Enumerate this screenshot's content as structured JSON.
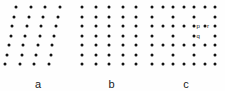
{
  "figure": {
    "width": 225,
    "height": 91,
    "background_color": "#fefefe",
    "dot_color": "#111111",
    "label_color": "#1a1a1a"
  },
  "chart_data": {
    "type": "scatter",
    "title": "",
    "subtitle": "",
    "xlabel": "",
    "ylabel": "",
    "grid": false,
    "legend": null,
    "panels": [
      {
        "id": "a",
        "label": "a",
        "lattice_type": "oblique",
        "rows": 7,
        "columns": 4,
        "row_spacing": 9.5,
        "column_spacing": 14.5,
        "row_shear_px": -1.8,
        "origin_x": 16,
        "origin_y": 7,
        "points": [
          [
            16.0,
            7.0
          ],
          [
            30.5,
            7.0
          ],
          [
            45.0,
            7.0
          ],
          [
            59.5,
            7.0
          ],
          [
            14.2,
            16.5
          ],
          [
            28.7,
            16.5
          ],
          [
            43.2,
            16.5
          ],
          [
            57.7,
            16.5
          ],
          [
            12.4,
            26.0
          ],
          [
            26.9,
            26.0
          ],
          [
            41.4,
            26.0
          ],
          [
            55.9,
            26.0
          ],
          [
            10.6,
            35.5
          ],
          [
            25.1,
            35.5
          ],
          [
            39.6,
            35.5
          ],
          [
            54.1,
            35.5
          ],
          [
            8.8,
            45.0
          ],
          [
            23.3,
            45.0
          ],
          [
            37.8,
            45.0
          ],
          [
            52.3,
            45.0
          ],
          [
            7.0,
            54.5
          ],
          [
            21.5,
            54.5
          ],
          [
            36.0,
            54.5
          ],
          [
            50.5,
            54.5
          ],
          [
            5.2,
            64.0
          ],
          [
            19.7,
            64.0
          ],
          [
            34.2,
            64.0
          ],
          [
            48.7,
            64.0
          ]
        ]
      },
      {
        "id": "b",
        "label": "b",
        "lattice_type": "square",
        "rows": 7,
        "columns": 5,
        "row_spacing": 9.5,
        "column_spacing": 13.5,
        "row_shear_px": 0,
        "origin_x": 6,
        "origin_y": 7,
        "points": [
          [
            6.0,
            7.0
          ],
          [
            19.5,
            7.0
          ],
          [
            33.0,
            7.0
          ],
          [
            46.5,
            7.0
          ],
          [
            60.0,
            7.0
          ],
          [
            6.0,
            16.5
          ],
          [
            19.5,
            16.5
          ],
          [
            33.0,
            16.5
          ],
          [
            46.5,
            16.5
          ],
          [
            60.0,
            16.5
          ],
          [
            6.0,
            26.0
          ],
          [
            19.5,
            26.0
          ],
          [
            33.0,
            26.0
          ],
          [
            46.5,
            26.0
          ],
          [
            60.0,
            26.0
          ],
          [
            6.0,
            35.5
          ],
          [
            19.5,
            35.5
          ],
          [
            33.0,
            35.5
          ],
          [
            46.5,
            35.5
          ],
          [
            60.0,
            35.5
          ],
          [
            6.0,
            45.0
          ],
          [
            19.5,
            45.0
          ],
          [
            33.0,
            45.0
          ],
          [
            46.5,
            45.0
          ],
          [
            60.0,
            45.0
          ],
          [
            6.0,
            54.5
          ],
          [
            19.5,
            54.5
          ],
          [
            33.0,
            54.5
          ],
          [
            46.5,
            54.5
          ],
          [
            60.0,
            54.5
          ],
          [
            6.0,
            64.0
          ],
          [
            19.5,
            64.0
          ],
          [
            33.0,
            64.0
          ],
          [
            46.5,
            64.0
          ],
          [
            60.0,
            64.0
          ]
        ]
      },
      {
        "id": "c",
        "label": "c",
        "lattice_type": "centred",
        "rows": 7,
        "columns": 7,
        "row_spacing": 9.5,
        "column_spacing": 10.5,
        "row_shear_px": 0,
        "origin_x": 5,
        "origin_y": 7,
        "full_rows": [
          1,
          3,
          5,
          7
        ],
        "sparse_rows": [
          2,
          4,
          6
        ],
        "sparse_row_columns": [
          1,
          3,
          5,
          7
        ],
        "points": [
          [
            5.0,
            7.0
          ],
          [
            15.5,
            7.0
          ],
          [
            26.0,
            7.0
          ],
          [
            36.5,
            7.0
          ],
          [
            47.0,
            7.0
          ],
          [
            57.5,
            7.0
          ],
          [
            68.0,
            7.0
          ],
          [
            5.0,
            16.5
          ],
          [
            26.0,
            16.5
          ],
          [
            47.0,
            16.5
          ],
          [
            68.0,
            16.5
          ],
          [
            5.0,
            26.0
          ],
          [
            15.5,
            26.0
          ],
          [
            26.0,
            26.0
          ],
          [
            36.5,
            26.0
          ],
          [
            47.0,
            26.0
          ],
          [
            57.5,
            26.0
          ],
          [
            68.0,
            26.0
          ],
          [
            5.0,
            35.5
          ],
          [
            26.0,
            35.5
          ],
          [
            47.0,
            35.5
          ],
          [
            68.0,
            35.5
          ],
          [
            5.0,
            45.0
          ],
          [
            15.5,
            45.0
          ],
          [
            26.0,
            45.0
          ],
          [
            36.5,
            45.0
          ],
          [
            47.0,
            45.0
          ],
          [
            57.5,
            45.0
          ],
          [
            68.0,
            45.0
          ],
          [
            5.0,
            54.5
          ],
          [
            26.0,
            54.5
          ],
          [
            47.0,
            54.5
          ],
          [
            68.0,
            54.5
          ],
          [
            5.0,
            64.0
          ],
          [
            15.5,
            64.0
          ],
          [
            26.0,
            64.0
          ],
          [
            36.5,
            64.0
          ],
          [
            47.0,
            64.0
          ],
          [
            57.5,
            64.0
          ],
          [
            68.0,
            64.0
          ]
        ],
        "annotations": [
          {
            "text": "p",
            "point_x": 47.0,
            "point_y": 26.0,
            "label_x": 49.5,
            "label_y": 26.0
          },
          {
            "text": "r",
            "point_x": 57.5,
            "point_y": 26.0,
            "label_x": 60.0,
            "label_y": 26.0
          },
          {
            "text": "q",
            "point_x": 47.0,
            "point_y": 35.5,
            "label_x": 49.5,
            "label_y": 35.5
          }
        ]
      }
    ]
  },
  "panel_offsets": {
    "a": 0,
    "b": 76,
    "c": 147
  },
  "panel_widths": {
    "a": 76,
    "b": 71,
    "c": 78
  }
}
